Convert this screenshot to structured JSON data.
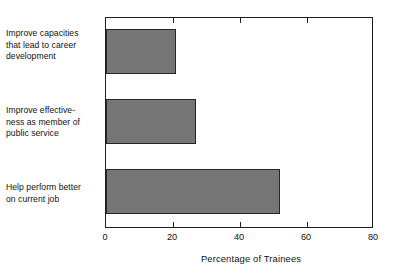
{
  "chart_data": {
    "type": "bar",
    "orientation": "horizontal",
    "title": "",
    "subtitle": "",
    "xlabel": "Percentage of Trainees",
    "ylabel": "",
    "xlim": [
      0,
      80
    ],
    "xticks": [
      0,
      20,
      40,
      60,
      80
    ],
    "xtick_labels": [
      "0",
      "20",
      "40",
      "60",
      "80"
    ],
    "grid": false,
    "legend": false,
    "legend_position": "none",
    "categories": [
      "Improve capacities that lead to career development",
      "Improve effectiveness as member of public service",
      "Help perform better on current job"
    ],
    "category_label_lines": [
      [
        "Improve capacities",
        "that lead to career",
        "development"
      ],
      [
        "Improve effective-",
        "ness as member of",
        "public service"
      ],
      [
        "Help perform better",
        "on current job"
      ]
    ],
    "values": [
      21,
      27,
      52
    ],
    "bar_color": "#767676",
    "bar_edge_color": "#262626",
    "axis_color": "#1f1f1f",
    "background_color": "#ffffff"
  },
  "axis": {
    "x_title": "Percentage of Trainees",
    "tick_0": "0",
    "tick_1": "20",
    "tick_2": "40",
    "tick_3": "60",
    "tick_4": "80"
  },
  "labels": {
    "cat0_line0": "Improve capacities",
    "cat0_line1": "that lead to career",
    "cat0_line2": "development",
    "cat1_line0": "Improve effective-",
    "cat1_line1": "ness as member of",
    "cat1_line2": "public service",
    "cat2_line0": "Help perform better",
    "cat2_line1": "on current job"
  }
}
